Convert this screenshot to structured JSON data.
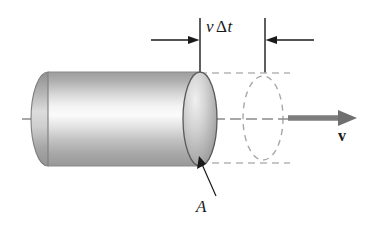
{
  "figure": {
    "background_color": "#ffffff",
    "width": 372,
    "height": 228
  },
  "labels": {
    "length_symbol": "v",
    "length_delta": "Δ",
    "length_time": "t",
    "area_label": "A",
    "velocity_label": "v"
  },
  "colors": {
    "ink": "#1a1a1a",
    "axis_line": "#8c8c8c",
    "ghost_outline": "#a8a8a8",
    "connector_dash": "#b5b5b5",
    "arrow_fill": "#7d7d7d",
    "cylinder_outline": "#6e6e6e",
    "cap_outline": "#555555",
    "body_light": "#f2f2f2",
    "body_mid": "#b9b9b9",
    "body_dark": "#9a9a9a"
  },
  "geometry": {
    "cylinder": {
      "left_x": 48,
      "right_x": 200,
      "top_y": 72,
      "bottom_y": 166,
      "cap_rx": 17,
      "cap_ry": 47,
      "axis_y": 119
    },
    "ghost_ellipse": {
      "center_x": 263,
      "center_y": 118,
      "rx": 20,
      "ry": 42
    },
    "dimension": {
      "left_extension_x": 200,
      "right_extension_x": 265,
      "extension_top_y": 18,
      "extension_bottom_y": 72,
      "arrow_y": 40
    },
    "velocity_arrow": {
      "start_x": 288,
      "end_x": 356,
      "y": 118
    },
    "leader": {
      "from_x": 216,
      "from_y": 196,
      "to_x": 199,
      "to_y": 158
    },
    "axis": {
      "start_x": 22,
      "end_x": 300
    }
  },
  "elements": {
    "cylinder_name": "shaded-cylinder",
    "cap_name": "cylinder-end-cap",
    "ghost_name": "ghost-ellipse",
    "axis_name": "center-axis-line",
    "velocity_arrow_name": "velocity-arrow",
    "dimension_name": "dimension-arrows",
    "leader_name": "area-leader-line"
  }
}
